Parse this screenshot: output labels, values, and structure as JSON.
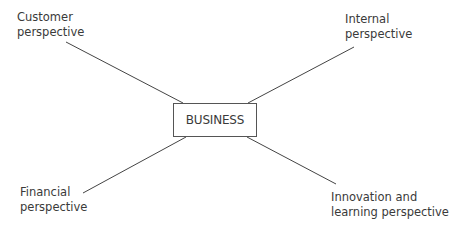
{
  "diagram": {
    "center": {
      "label": "BUSINESS"
    },
    "nodes": [
      {
        "id": "customer",
        "line1": "Customer",
        "line2": "perspective",
        "position": "top-left"
      },
      {
        "id": "internal",
        "line1": "Internal",
        "line2": "perspective",
        "position": "top-right"
      },
      {
        "id": "financial",
        "line1": "Financial",
        "line2": "perspective",
        "position": "bottom-left"
      },
      {
        "id": "innovation",
        "line1": "Innovation and",
        "line2": "learning perspective",
        "position": "bottom-right"
      }
    ],
    "colors": {
      "line": "#444444",
      "text": "#3a3a3a",
      "box_border": "#555555"
    }
  }
}
